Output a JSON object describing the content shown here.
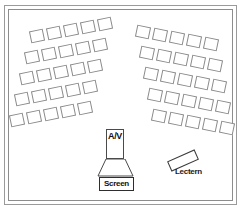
{
  "plan": {
    "title": "Classroom Seating Plan",
    "frame": {
      "border_color": "#9a9a9a"
    }
  },
  "seating": {
    "blocks": [
      {
        "name": "left-seating-block",
        "rows": 5,
        "seats_per_row": 5,
        "total_seats": 25,
        "rotation_deg": -12,
        "origin_x": 30,
        "origin_y": 30,
        "row_step_x": -5,
        "row_step_y": 21,
        "seat_step_x": 17,
        "seat_step_y": -3
      },
      {
        "name": "right-seating-block",
        "rows": 5,
        "seats_per_row": 5,
        "total_seats": 25,
        "rotation_deg": 12,
        "origin_x": 136,
        "origin_y": 26,
        "row_step_x": 4,
        "row_step_y": 21,
        "seat_step_x": 17,
        "seat_step_y": 3
      }
    ],
    "seat_label": "seat",
    "total_seats": 50
  },
  "fixtures": {
    "av": {
      "label": "A/V",
      "name": "av-projector"
    },
    "screen": {
      "label": "Screen",
      "name": "projection-screen"
    },
    "lectern": {
      "label": "Lectern",
      "name": "lectern"
    }
  },
  "colors": {
    "seat_outline": "#8a8a8a",
    "fixture_outline": "#2e2e2e",
    "frame": "#9a9a9a",
    "background": "#ffffff",
    "text": "#111111"
  }
}
